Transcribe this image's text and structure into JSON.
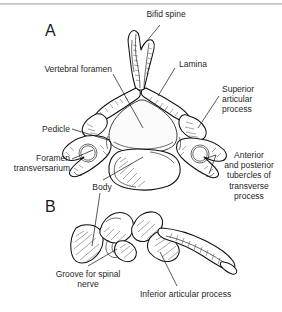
{
  "figure": {
    "title_rule": "divider",
    "panels": [
      {
        "id": "A",
        "letter": "A",
        "view": "superior view of cervical vertebra"
      },
      {
        "id": "B",
        "letter": "B",
        "view": "lateral view of cervical vertebra"
      }
    ]
  },
  "labels": {
    "bifid_spine": "Bifid spine",
    "vertebral_foramen": "Vertebral foramen",
    "lamina": "Lamina",
    "superior_articular_process": "Superior\narticular\nprocess",
    "pedicle": "Pedicle",
    "foramen_transversarium": "Foramen\ntransversarium",
    "anterior_posterior_tubercles": "Anterior\nand posterior\ntubercles of\ntransverse\nprocess",
    "body": "Body",
    "groove_for_spinal_nerve": "Groove for spinal\nnerve",
    "inferior_articular_process": "Inferior articular process"
  },
  "colors": {
    "ink": "#111111",
    "paper": "#ffffff",
    "rule": "#bdbdbd",
    "text": "#1f1f1f"
  }
}
